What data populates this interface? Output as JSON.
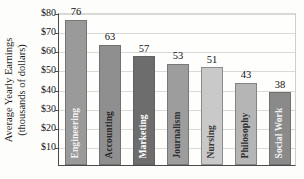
{
  "chart_data": {
    "type": "bar",
    "title": "",
    "subtitle": "",
    "xlabel": "",
    "ylabel": "Average Yearly Earnings (thousands of dollars)",
    "ylabel_line1": "Average Yearly Earnings",
    "ylabel_line2": "(thousands of dollars)",
    "categories": [
      "Engineering",
      "Accounting",
      "Marketing",
      "Journalism",
      "Nursing",
      "Philosophy",
      "Social Work"
    ],
    "values": [
      76,
      63,
      57,
      53,
      51,
      43,
      38
    ],
    "value_labels": [
      "76",
      "63",
      "57",
      "53",
      "51",
      "43",
      "38"
    ],
    "bar_colors": [
      "#9a9a9a",
      "#8f8f8f",
      "#6d6d6d",
      "#9d9d9d",
      "#c9c9c9",
      "#b5b5b5",
      "#8a8a8a"
    ],
    "label_colors": [
      "#f2f2f2",
      "#2a2a2a",
      "#ffffff",
      "#2f2f2f",
      "#3a3a3a",
      "#2e2e2e",
      "#f2f2f2"
    ],
    "ylim": [
      0,
      80
    ],
    "ytick_values": [
      80,
      70,
      60,
      50,
      40,
      30,
      20,
      10
    ],
    "ytick_labels": [
      "$80",
      "$70",
      "$60",
      "$50",
      "$40",
      "$30",
      "$20",
      "$10"
    ],
    "grid": true,
    "grid_axis": "y",
    "legend": false,
    "legend_position": "none",
    "units": "thousands of dollars"
  }
}
